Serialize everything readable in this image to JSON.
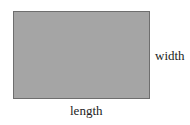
{
  "diagram": {
    "shape": "rectangle",
    "fill_color": "#a5a5a5",
    "border_color": "#6e6e6e",
    "labels": {
      "width": "width",
      "length": "length"
    }
  }
}
